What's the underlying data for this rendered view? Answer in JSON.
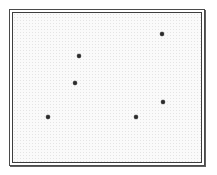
{
  "figure": {
    "name": "scatter-plot-figure",
    "background_color": "#fafafa",
    "frame_color": "#4a4a4a",
    "point_color": "#2b2b2b",
    "frame_style": "double-rule-rectangle"
  },
  "chart_data": {
    "type": "scatter",
    "title": "",
    "xlabel": "",
    "ylabel": "",
    "grid": false,
    "legend": null,
    "axis_ticks": [],
    "tick_labels": [],
    "xlim": [
      0,
      188
    ],
    "ylim": [
      0,
      149
    ],
    "note": "Unlabeled scatter plot: six black markers inside a plain double-ruled rectangular frame. No axes ticks, no gridlines, no legend, no text.",
    "point_count": 6,
    "points": [
      {
        "label": "",
        "x": 149,
        "y": 21
      },
      {
        "label": "",
        "x": 66,
        "y": 43
      },
      {
        "label": "",
        "x": 62,
        "y": 70
      },
      {
        "label": "",
        "x": 150,
        "y": 89
      },
      {
        "label": "",
        "x": 35,
        "y": 104
      },
      {
        "label": "",
        "x": 123,
        "y": 104
      }
    ]
  }
}
